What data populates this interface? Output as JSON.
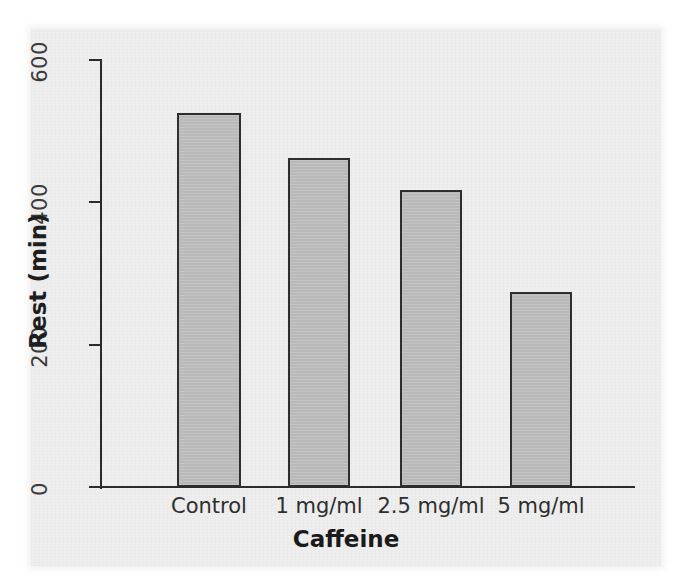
{
  "chart_data": {
    "type": "bar",
    "title": "",
    "subtitle": "",
    "xlabel": "Caffeine",
    "ylabel": "Rest (min)",
    "categories": [
      "Control",
      "1 mg/ml",
      "2.5 mg/ml",
      "5 mg/ml"
    ],
    "values": [
      525,
      462,
      417,
      274
    ],
    "ylim": [
      0,
      600
    ],
    "y_ticks": [
      0,
      200,
      400,
      600
    ],
    "y_tick_labels": [
      "0",
      "200",
      "400",
      "600"
    ],
    "grid": false,
    "legend": null,
    "annotations": [],
    "series": [
      {
        "name": "Rest (min)",
        "values": [
          525,
          462,
          417,
          274
        ]
      }
    ]
  },
  "style": {
    "bar_fill": "#bdbdbd",
    "bar_stroke": "#2e2e2e",
    "axis_color": "#2b2b2b",
    "text_color": "#1e1e1e",
    "plot_background": "#eeeeee",
    "page_background": "#ffffff"
  },
  "axes": {
    "y_title": "Rest (min)",
    "x_title": "Caffeine"
  },
  "bars": [
    {
      "label": "Control",
      "value": 525
    },
    {
      "label": "1 mg/ml",
      "value": 462
    },
    {
      "label": "2.5 mg/ml",
      "value": 417
    },
    {
      "label": "5 mg/ml",
      "value": 274
    }
  ]
}
